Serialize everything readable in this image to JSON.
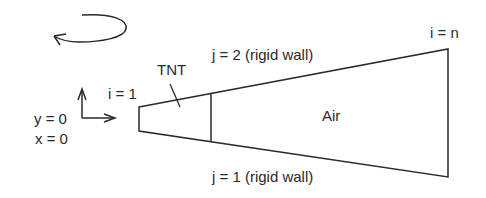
{
  "diagram": {
    "type": "computational-domain-schematic",
    "colors": {
      "stroke": "#2a2a2a",
      "text": "#2a2a2a",
      "background": "#ffffff"
    },
    "rotation_indicator": {
      "icon": "counterclockwise-curved-arrow-icon"
    },
    "axes": {
      "icon": "coordinate-axes-icon",
      "y_label": "y = 0",
      "x_label": "x = 0"
    },
    "labels": {
      "i_start": "i = 1",
      "i_end": "i = n",
      "tnt": "TNT",
      "air": "Air",
      "top_wall": "j = 2 (rigid wall)",
      "bottom_wall": "j = 1 (rigid wall)"
    },
    "regions": [
      {
        "name": "TNT",
        "description": "left section of tapered domain"
      },
      {
        "name": "Air",
        "description": "right section of tapered domain"
      }
    ],
    "boundaries": [
      {
        "index": "j = 2",
        "type": "rigid wall",
        "position": "top"
      },
      {
        "index": "j = 1",
        "type": "rigid wall",
        "position": "bottom"
      },
      {
        "index": "i = 1",
        "position": "left"
      },
      {
        "index": "i = n",
        "position": "right"
      }
    ]
  }
}
